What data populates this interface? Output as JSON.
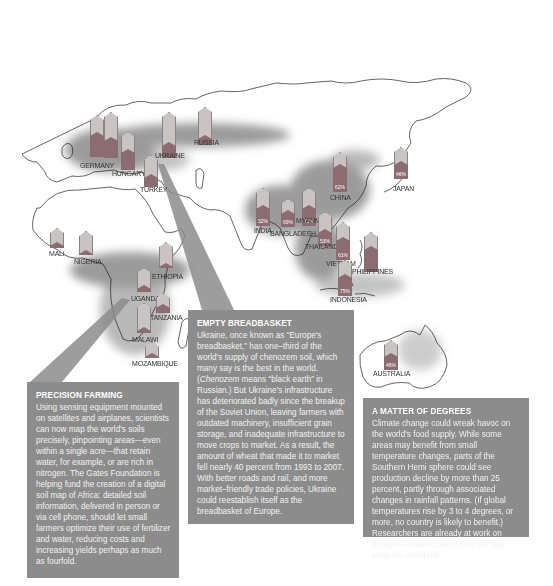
{
  "map": {
    "colors": {
      "bar_empty": "#c9c3c3",
      "bar_fill": "#8b6c70",
      "callout": "#8c8c8c",
      "land_outline": "#222222",
      "soil_dark": "#6b6b6b"
    },
    "markers": [
      {
        "country": "Germany",
        "label": "GERMANY",
        "x": 90,
        "y": 115,
        "h": 42,
        "fill": 0.6,
        "pct": "",
        "lx": 80,
        "ly": 162
      },
      {
        "country": "UK-area",
        "label": "",
        "x": 104,
        "y": 112,
        "h": 46,
        "fill": 0.45,
        "pct": "",
        "lx": 0,
        "ly": 0
      },
      {
        "country": "Hungary",
        "label": "HUNGARY",
        "x": 121,
        "y": 132,
        "h": 38,
        "fill": 0.55,
        "pct": "",
        "lx": 112,
        "ly": 170
      },
      {
        "country": "Ukraine",
        "label": "UKRAINE",
        "x": 162,
        "y": 112,
        "h": 46,
        "fill": 0.35,
        "pct": "",
        "lx": 155,
        "ly": 152
      },
      {
        "country": "Russia",
        "label": "RUSSIA",
        "x": 198,
        "y": 107,
        "h": 38,
        "fill": 0.25,
        "pct": "",
        "lx": 194,
        "ly": 139
      },
      {
        "country": "Turkey",
        "label": "TURKEY",
        "x": 144,
        "y": 155,
        "h": 32,
        "fill": 0.4,
        "pct": "",
        "lx": 140,
        "ly": 186
      },
      {
        "country": "India",
        "label": "INDIA",
        "x": 256,
        "y": 188,
        "h": 38,
        "fill": 0.55,
        "pct": "32%",
        "lx": 254,
        "ly": 227
      },
      {
        "country": "Bangladesh",
        "label": "BANGLADESH",
        "x": 281,
        "y": 199,
        "h": 28,
        "fill": 0.6,
        "pct": "69%",
        "lx": 270,
        "ly": 230
      },
      {
        "country": "Myanmar",
        "label": "MYANMAR",
        "x": 302,
        "y": 188,
        "h": 38,
        "fill": 0.55,
        "pct": "71%",
        "lx": 296,
        "ly": 217
      },
      {
        "country": "Thailand",
        "label": "THAILAND",
        "x": 318,
        "y": 212,
        "h": 34,
        "fill": 0.5,
        "pct": "53%",
        "lx": 305,
        "ly": 243
      },
      {
        "country": "Vietnam",
        "label": "VIETNAM",
        "x": 336,
        "y": 222,
        "h": 38,
        "fill": 0.6,
        "pct": "61%",
        "lx": 326,
        "ly": 260
      },
      {
        "country": "China",
        "label": "CHINA",
        "x": 333,
        "y": 152,
        "h": 40,
        "fill": 0.7,
        "pct": "62%",
        "lx": 330,
        "ly": 194
      },
      {
        "country": "Japan",
        "label": "JAPAN",
        "x": 394,
        "y": 147,
        "h": 32,
        "fill": 0.55,
        "pct": "46%",
        "lx": 393,
        "ly": 185
      },
      {
        "country": "Philippines",
        "label": "PHILIPPINES",
        "x": 364,
        "y": 232,
        "h": 40,
        "fill": 0.65,
        "pct": "",
        "lx": 352,
        "ly": 268
      },
      {
        "country": "Indonesia",
        "label": "INDONESIA",
        "x": 338,
        "y": 260,
        "h": 36,
        "fill": 0.6,
        "pct": "75%",
        "lx": 330,
        "ly": 296
      },
      {
        "country": "Mali",
        "label": "MALI",
        "x": 50,
        "y": 228,
        "h": 20,
        "fill": 0.3,
        "pct": "",
        "lx": 49,
        "ly": 250
      },
      {
        "country": "Nigeria",
        "label": "NIGERIA",
        "x": 79,
        "y": 231,
        "h": 24,
        "fill": 0.2,
        "pct": "",
        "lx": 74,
        "ly": 258
      },
      {
        "country": "Ethiopia",
        "label": "ETHIOPIA",
        "x": 159,
        "y": 242,
        "h": 26,
        "fill": 0.2,
        "pct": "",
        "lx": 152,
        "ly": 273
      },
      {
        "country": "Uganda",
        "label": "UGANDA",
        "x": 137,
        "y": 268,
        "h": 24,
        "fill": 0.3,
        "pct": "",
        "lx": 131,
        "ly": 295
      },
      {
        "country": "Tanzania",
        "label": "TANZANIA",
        "x": 156,
        "y": 293,
        "h": 20,
        "fill": 0.45,
        "pct": "",
        "lx": 150,
        "ly": 314
      },
      {
        "country": "Malawi",
        "label": "MALAWI",
        "x": 137,
        "y": 303,
        "h": 30,
        "fill": 0.2,
        "pct": "",
        "lx": 132,
        "ly": 336
      },
      {
        "country": "Mozambique",
        "label": "MOZAMBIQUE",
        "x": 145,
        "y": 342,
        "h": 16,
        "fill": 0.3,
        "pct": "",
        "lx": 132,
        "ly": 360
      },
      {
        "country": "Australia",
        "label": "AUSTRALIA",
        "x": 384,
        "y": 340,
        "h": 30,
        "fill": 0.55,
        "pct": "46%",
        "lx": 373,
        "ly": 370
      }
    ]
  },
  "callouts": {
    "precision": {
      "title": "PRECISION FARMING",
      "body": "Using sensing equipment mounted on satellites and airplanes, scientists can now map the world's soils precisely, pinpointing areas—even within a single acre—that retain water, for example, or are rich in nitrogen. The Gates Foundation is helping fund the creation of a digital soil map of Africa: detailed soil information, delivered in person or via cell phone, should let small farmers optimize their use of fertilizer and water, reducing costs and increasing yields perhaps as much as fourfold."
    },
    "breadbasket": {
      "title": "EMPTY BREADBASKET",
      "body_1": "Ukraine, once known as “Europe's breadbasket,” has one–third of the world's supply of chenozem soil, which many say is the best in the world. (",
      "body_italic": "Chenozem",
      "body_2": " means “black earth” in Russian.) But Ukraine's infrastructure has deteriorated badly since the breakup of the Soviet Union, leaving farmers with outdated machinery, insufficient grain storage, and inadequate infrastructure to move crops to market. As a result, the amount of wheat that made it to market fell nearly 40 percent from 1993 to 2007. With better roads and rail, and more market–friendly trade policies, Ukraine could reestablish itself as the breadbasket of Europe."
    },
    "degrees": {
      "title": "A MATTER OF DEGREES",
      "body": "Climate change could wreak havoc on the world's food supply. While some areas may benefit from small temperature changes, parts of the Southern Hemi sphere could see production decline by more than 25 percent, partly through associated changes in rainfall patterns. (If global temperatures rise by 3 to 4 degrees, or more, no country is likely to benefit.) Researchers are already at work on drought-resistant plants that will help keep the world fed."
    }
  }
}
